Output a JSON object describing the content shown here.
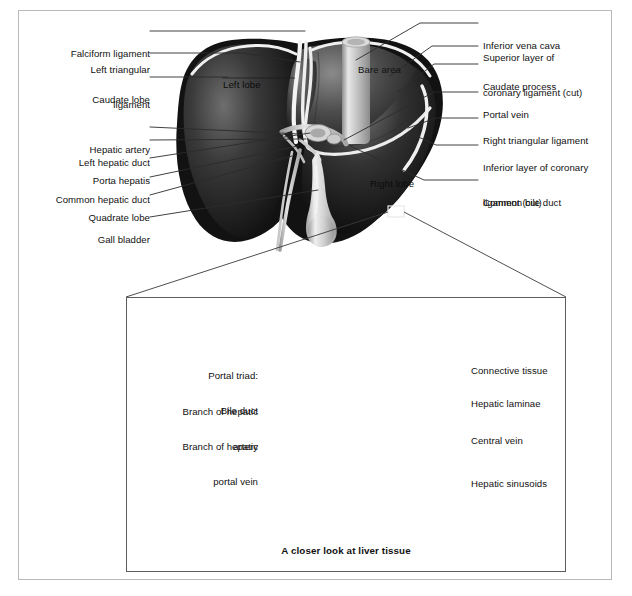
{
  "figure": {
    "caption": "A closer look at liver tissue"
  },
  "colors": {
    "frame_outer": "#b9b9b9",
    "frame_inset": "#5d5d5d",
    "leader_line": "#2b2b2b",
    "text": "#111111",
    "liver_dark": "#1d1d1d",
    "liver_mid": "#4a4a4a",
    "liver_light": "#8e8e8e",
    "ligament_white": "#f2f2f2",
    "vessel_grey": "#b7b7b7",
    "lobule_fill": "#d9d9d4",
    "lobule_sinusoid": "#9a9a9a"
  },
  "top_panel": {
    "labels_left": [
      {
        "id": "falciform-ligament",
        "text": "Falciform ligament",
        "lines": [
          "Falciform ligament"
        ]
      },
      {
        "id": "left-triangular-ligament",
        "text": "Left triangular ligament",
        "lines": [
          "Left triangular",
          "ligament"
        ]
      },
      {
        "id": "caudate-lobe",
        "text": "Caudate lobe",
        "lines": [
          "Caudate lobe"
        ]
      },
      {
        "id": "hepatic-artery",
        "text": "Hepatic artery",
        "lines": [
          "Hepatic artery"
        ]
      },
      {
        "id": "left-hepatic-duct",
        "text": "Left hepatic duct",
        "lines": [
          "Left hepatic duct"
        ]
      },
      {
        "id": "porta-hepatis",
        "text": "Porta hepatis",
        "lines": [
          "Porta hepatis"
        ]
      },
      {
        "id": "common-hepatic-duct",
        "text": "Common hepatic duct",
        "lines": [
          "Common hepatic duct"
        ]
      },
      {
        "id": "quadrate-lobe",
        "text": "Quadrate lobe",
        "lines": [
          "Quadrate lobe"
        ]
      },
      {
        "id": "gall-bladder",
        "text": "Gall bladder",
        "lines": [
          "Gall bladder"
        ]
      }
    ],
    "labels_right": [
      {
        "id": "inferior-vena-cava",
        "text": "Inferior vena cava",
        "lines": [
          "Inferior vena cava"
        ]
      },
      {
        "id": "superior-layer-coronary-ligament",
        "text": "Superior layer of coronary ligament (cut)",
        "lines": [
          "Superior layer of",
          "coronary ligament (cut)"
        ]
      },
      {
        "id": "caudate-process",
        "text": "Caudate process",
        "lines": [
          "Caudate process"
        ]
      },
      {
        "id": "portal-vein",
        "text": "Portal vein",
        "lines": [
          "Portal vein"
        ]
      },
      {
        "id": "right-triangular-ligament",
        "text": "Right triangular ligament",
        "lines": [
          "Right triangular ligament"
        ]
      },
      {
        "id": "inferior-layer-coronary-ligament",
        "text": "Inferior layer of coronary ligament (cut)",
        "lines": [
          "Inferior layer of coronary",
          "ligament (cut)"
        ]
      },
      {
        "id": "common-bile-duct",
        "text": "Common bile duct",
        "lines": [
          "Common bile duct"
        ]
      }
    ],
    "in_image_labels": [
      {
        "id": "left-lobe",
        "text": "Left lobe"
      },
      {
        "id": "bare-area",
        "text": "Bare area"
      },
      {
        "id": "right-lobe",
        "text": "Right lobe"
      }
    ]
  },
  "inset_panel": {
    "labels_left": [
      {
        "id": "portal-triad-bile-duct",
        "text": "Portal triad: Bile duct",
        "lines": [
          "Portal triad:",
          "Bile duct"
        ]
      },
      {
        "id": "branch-hepatic-artery",
        "text": "Branch of hepatic artery",
        "lines": [
          "Branch of hepatic",
          "artery"
        ]
      },
      {
        "id": "branch-hepatic-portal-vein",
        "text": "Branch of hepatic portal vein",
        "lines": [
          "Branch of hepatic",
          "portal vein"
        ]
      }
    ],
    "labels_right": [
      {
        "id": "connective-tissue",
        "text": "Connective tissue",
        "lines": [
          "Connective tissue"
        ]
      },
      {
        "id": "hepatic-laminae",
        "text": "Hepatic laminae",
        "lines": [
          "Hepatic laminae"
        ]
      },
      {
        "id": "central-vein",
        "text": "Central vein",
        "lines": [
          "Central vein"
        ]
      },
      {
        "id": "hepatic-sinusoids",
        "text": "Hepatic sinusoids",
        "lines": [
          "Hepatic sinusoids"
        ]
      }
    ]
  }
}
